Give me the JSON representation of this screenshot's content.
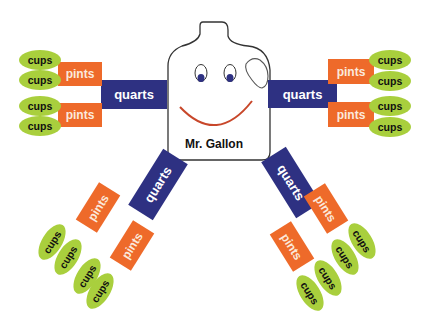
{
  "title": "Mr. Gallon",
  "labels": {
    "quarts": "quarts",
    "pints": "pints",
    "cups": "cups"
  },
  "colors": {
    "quarts": "#2e3182",
    "pints": "#ee6a2a",
    "cups": "#a9cf3d",
    "smile": "#c8472a",
    "eyes": "#2e3182"
  },
  "structure": {
    "gallon": 1,
    "quarts_per_gallon": 4,
    "pints_per_quart": 2,
    "cups_per_pint": 2
  }
}
